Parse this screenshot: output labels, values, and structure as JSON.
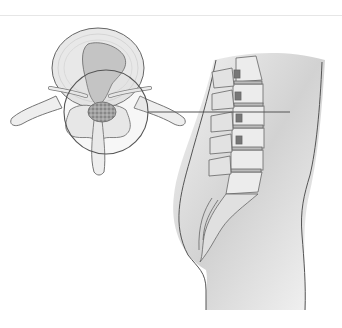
{
  "illustration": {
    "subject": "lumbar spine disc herniation",
    "views": [
      "axial vertebra cross-section",
      "sagittal lumbar spine in torso"
    ],
    "colors": {
      "background": "#ffffff",
      "outline": "#555555",
      "bone": "#e4e4e4",
      "disc": "#bdbdbd",
      "body_shade": "#d4d4d4",
      "herniation": "#8a8a8a"
    }
  }
}
